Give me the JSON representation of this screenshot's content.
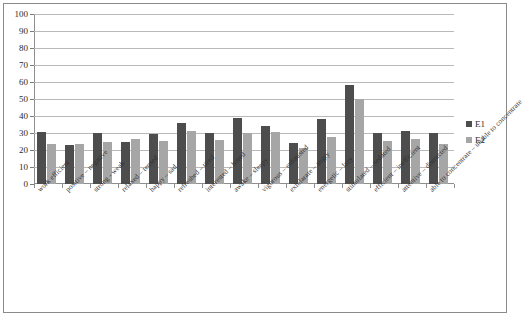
{
  "chart_data": {
    "type": "bar",
    "title": "",
    "subtitle": "",
    "xlabel": "",
    "ylabel": "",
    "ylim": [
      0,
      100
    ],
    "yticks": [
      0,
      10,
      20,
      30,
      40,
      50,
      60,
      70,
      80,
      90,
      100
    ],
    "grid": true,
    "legend_position": "right",
    "categories": [
      "work efficient",
      "positive – negative",
      "strong - weak",
      "relaxed – tensed",
      "happy – sad",
      "refreshed – tired",
      "interested – bored",
      "awake – sleepy",
      "vigorous – exhausted",
      "exhilarate – angry",
      "energetic – lazy",
      "stimulated – sedated",
      "efficient – inefficient",
      "attentive – distracted",
      "able to concentrate – unable to concentrate"
    ],
    "series": [
      {
        "name": "E1",
        "color": "#4d4d4d",
        "values": [
          30.5,
          23,
          30,
          24.5,
          29.5,
          36,
          30,
          39,
          34,
          24,
          38.5,
          58,
          30,
          31,
          30
        ]
      },
      {
        "name": "E2",
        "color": "#a6a6a6",
        "values": [
          23.5,
          23.5,
          24.5,
          26.5,
          25.5,
          31,
          26,
          30,
          30.5,
          21,
          27.5,
          50,
          25.5,
          26.5,
          23.5
        ]
      }
    ]
  },
  "legend": {
    "items": [
      {
        "label": "E1",
        "color": "#4d4d4d"
      },
      {
        "label": "E2",
        "color": "#a6a6a6"
      }
    ]
  }
}
